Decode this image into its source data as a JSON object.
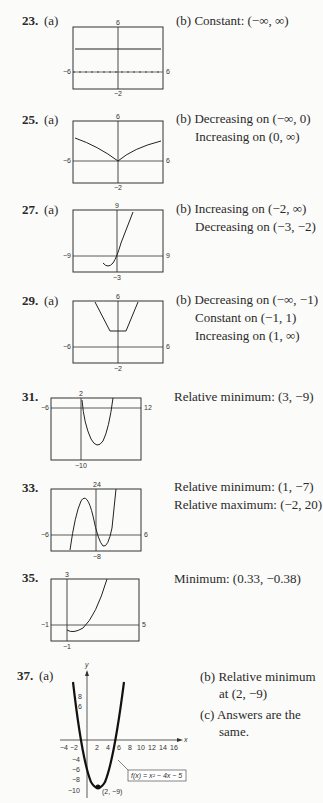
{
  "problems": [
    {
      "num": "23.",
      "part": "(a)",
      "lines": [
        "(b)  Constant:  (−∞, ∞)"
      ],
      "window": {
        "xmin": "−6",
        "xmax": "6",
        "ymin": "−2",
        "ymax": "6"
      }
    },
    {
      "num": "25.",
      "part": "(a)",
      "lines": [
        "(b)  Decreasing on (−∞, 0)",
        "Increasing on (0, ∞)"
      ],
      "window": {
        "xmin": "−6",
        "xmax": "6",
        "ymin": "−2",
        "ymax": "6"
      }
    },
    {
      "num": "27.",
      "part": "(a)",
      "lines": [
        "(b)  Increasing on (−2, ∞)",
        "Decreasing on (−3, −2)"
      ],
      "window": {
        "xmin": "−9",
        "xmax": "9",
        "ymin": "−3",
        "ymax": "9"
      }
    },
    {
      "num": "29.",
      "part": "(a)",
      "lines": [
        "(b)  Decreasing on (−∞, −1)",
        "Constant on (−1, 1)",
        "Increasing on (1, ∞)"
      ],
      "window": {
        "xmin": "−6",
        "xmax": "6",
        "ymin": "−2",
        "ymax": "6"
      }
    },
    {
      "num": "31.",
      "lines": [
        "Relative minimum:  (3, −9)"
      ],
      "window": {
        "xmin": "−6",
        "xmax": "12",
        "ymin": "−10",
        "ymax": "2"
      }
    },
    {
      "num": "33.",
      "lines": [
        "Relative minimum:  (1, −7)",
        "Relative maximum:  (−2, 20)"
      ],
      "window": {
        "xmin": "−6",
        "xmax": "6",
        "ymin": "−8",
        "ymax": "24"
      }
    },
    {
      "num": "35.",
      "lines": [
        "Minimum:  (0.33, −0.38)"
      ],
      "window": {
        "xmin": "−1",
        "xmax": "5",
        "ymin": "−1",
        "ymax": "3"
      }
    },
    {
      "num": "37.",
      "part": "(a)",
      "lines": [
        "(b)  Relative minimum",
        "at (2, −9)",
        "(c)  Answers are the",
        "same."
      ],
      "graph": {
        "function_label": "f(x) = x² − 4x − 5",
        "point_label": "(2, −9)",
        "x_axis": "x",
        "y_axis": "y",
        "x_ticks": [
          "−4",
          "−2",
          "2",
          "4",
          "6",
          "8",
          "10",
          "12",
          "14",
          "16"
        ],
        "y_ticks": [
          "8",
          "6",
          "−4",
          "−6",
          "−8",
          "−10"
        ]
      }
    }
  ]
}
